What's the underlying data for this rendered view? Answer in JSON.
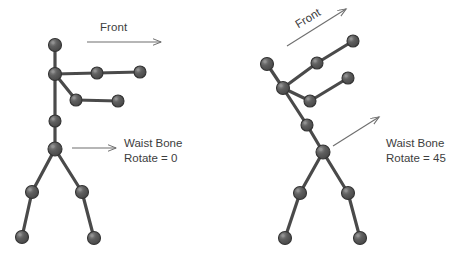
{
  "canvas": {
    "width": 454,
    "height": 256,
    "background": "#ffffff"
  },
  "style": {
    "bone_color": "#4a4a4a",
    "joint_fill": "#5a5a5a",
    "joint_stroke": "#333333",
    "joint_highlight": "#9a9a9a",
    "arrow_color": "#6e6e6e",
    "text_color": "#3d3d3d"
  },
  "figures": [
    {
      "id": "figure-left",
      "front_label": "Front",
      "front_arrow": {
        "x1": 87,
        "y1": 42,
        "x2": 161,
        "y2": 42,
        "rotation_deg": 0
      },
      "pointer_arrow": {
        "x1": 72,
        "y1": 148,
        "x2": 116,
        "y2": 148
      },
      "caption": {
        "line1": "Waist Bone",
        "line2": "Rotate = 0"
      },
      "rotate_value": 0,
      "joints": [
        {
          "name": "head",
          "x": 55,
          "y": 45,
          "r": 6.5
        },
        {
          "name": "neck",
          "x": 55,
          "y": 74,
          "r": 6.5
        },
        {
          "name": "arm-a-mid",
          "x": 97,
          "y": 73,
          "r": 6.0
        },
        {
          "name": "arm-a-end",
          "x": 140,
          "y": 72,
          "r": 6.0
        },
        {
          "name": "arm-b-mid",
          "x": 76,
          "y": 100,
          "r": 6.0
        },
        {
          "name": "arm-b-end",
          "x": 118,
          "y": 101,
          "r": 6.0
        },
        {
          "name": "spine",
          "x": 55,
          "y": 121,
          "r": 6.0
        },
        {
          "name": "waist",
          "x": 55,
          "y": 149,
          "r": 7.0
        },
        {
          "name": "knee-left",
          "x": 32,
          "y": 192,
          "r": 6.5
        },
        {
          "name": "foot-left",
          "x": 22,
          "y": 237,
          "r": 6.5
        },
        {
          "name": "knee-right",
          "x": 82,
          "y": 192,
          "r": 6.5
        },
        {
          "name": "foot-right",
          "x": 94,
          "y": 238,
          "r": 6.5
        }
      ],
      "bones": [
        [
          "head",
          "neck"
        ],
        [
          "neck",
          "arm-a-mid"
        ],
        [
          "arm-a-mid",
          "arm-a-end"
        ],
        [
          "neck",
          "arm-b-mid"
        ],
        [
          "arm-b-mid",
          "arm-b-end"
        ],
        [
          "neck",
          "spine"
        ],
        [
          "spine",
          "waist"
        ],
        [
          "waist",
          "knee-left"
        ],
        [
          "knee-left",
          "foot-left"
        ],
        [
          "waist",
          "knee-right"
        ],
        [
          "knee-right",
          "foot-right"
        ]
      ]
    },
    {
      "id": "figure-right",
      "front_label": "Front",
      "front_arrow": {
        "x1": 287,
        "y1": 46,
        "x2": 346,
        "y2": 9,
        "rotation_deg": -31
      },
      "pointer_arrow": {
        "x1": 333,
        "y1": 146,
        "x2": 379,
        "y2": 117
      },
      "caption": {
        "line1": "Waist Bone",
        "line2": "Rotate = 45"
      },
      "rotate_value": 45,
      "joints": [
        {
          "name": "head",
          "x": 267,
          "y": 64,
          "r": 6.5
        },
        {
          "name": "neck",
          "x": 283,
          "y": 88,
          "r": 6.5
        },
        {
          "name": "arm-a-mid",
          "x": 317,
          "y": 63,
          "r": 6.0
        },
        {
          "name": "arm-a-end",
          "x": 353,
          "y": 41,
          "r": 6.0
        },
        {
          "name": "arm-b-mid",
          "x": 310,
          "y": 101,
          "r": 6.0
        },
        {
          "name": "arm-b-end",
          "x": 348,
          "y": 78,
          "r": 6.0
        },
        {
          "name": "spine",
          "x": 307,
          "y": 125,
          "r": 6.0
        },
        {
          "name": "waist",
          "x": 323,
          "y": 152,
          "r": 7.0
        },
        {
          "name": "knee-left",
          "x": 300,
          "y": 193,
          "r": 6.5
        },
        {
          "name": "foot-left",
          "x": 285,
          "y": 238,
          "r": 6.5
        },
        {
          "name": "knee-right",
          "x": 348,
          "y": 193,
          "r": 6.5
        },
        {
          "name": "foot-right",
          "x": 360,
          "y": 238,
          "r": 6.5
        }
      ],
      "bones": [
        [
          "head",
          "neck"
        ],
        [
          "neck",
          "arm-a-mid"
        ],
        [
          "arm-a-mid",
          "arm-a-end"
        ],
        [
          "neck",
          "arm-b-mid"
        ],
        [
          "arm-b-mid",
          "arm-b-end"
        ],
        [
          "neck",
          "spine"
        ],
        [
          "spine",
          "waist"
        ],
        [
          "waist",
          "knee-left"
        ],
        [
          "knee-left",
          "foot-left"
        ],
        [
          "waist",
          "knee-right"
        ],
        [
          "knee-right",
          "foot-right"
        ]
      ]
    }
  ]
}
